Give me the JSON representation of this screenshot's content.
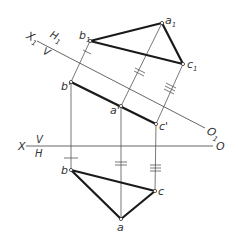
{
  "colors": {
    "line": "#555555",
    "edge": "#1a1a1a",
    "text": "#333333"
  },
  "axes": {
    "main": {
      "x_label": "X",
      "o_label": "O",
      "upper_label": "V",
      "lower_label": "H"
    },
    "aux": {
      "x_label": "X",
      "x_sub": "1",
      "o_label": "O",
      "o_sub": "1",
      "upper_label": "H",
      "upper_sub": "1",
      "lower_label": "V"
    }
  },
  "points": {
    "a1": {
      "label": "a",
      "sub": "1"
    },
    "b1": {
      "label": "b",
      "sub": "1"
    },
    "c1": {
      "label": "c",
      "sub": "1"
    },
    "a_prime": {
      "label": "a'"
    },
    "b_prime": {
      "label": "b'"
    },
    "c_prime": {
      "label": "c'"
    },
    "a": {
      "label": "a"
    },
    "b": {
      "label": "b"
    },
    "c": {
      "label": "c"
    }
  }
}
